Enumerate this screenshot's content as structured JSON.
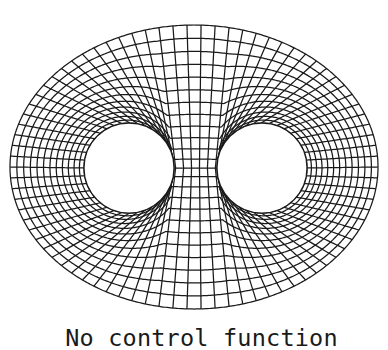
{
  "caption": "No control function",
  "colors": {
    "background": "#ffffff",
    "line": "#1a1a1a"
  },
  "diagram": {
    "type": "structured-mesh",
    "outer_boundary": {
      "shape": "ellipse",
      "cx": 194,
      "cy": 167,
      "rx": 184,
      "ry": 142
    },
    "holes": [
      {
        "name": "left-hole",
        "shape": "circle",
        "cx": 129,
        "cy": 168,
        "r": 45
      },
      {
        "name": "right-hole",
        "shape": "circle",
        "cx": 262,
        "cy": 168,
        "r": 45
      }
    ],
    "neck_cut": {
      "y": 168,
      "x_from": 174,
      "x_to": 217
    },
    "angular_lines": 82,
    "radial_layers": 12,
    "radial_stretch": 1.12,
    "line_width": 1.25
  }
}
